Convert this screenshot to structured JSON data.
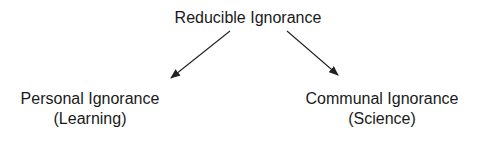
{
  "diagram": {
    "root": {
      "label": "Reducible Ignorance"
    },
    "children": [
      {
        "label": "Personal Ignorance",
        "sublabel": "(Learning)"
      },
      {
        "label": "Communal Ignorance",
        "sublabel": "(Science)"
      }
    ],
    "edges": [
      {
        "from": "Reducible Ignorance",
        "to": "Personal Ignorance"
      },
      {
        "from": "Reducible Ignorance",
        "to": "Communal Ignorance"
      }
    ],
    "colors": {
      "text": "#1a1a1a",
      "arrow": "#222222",
      "background": "#ffffff"
    }
  }
}
